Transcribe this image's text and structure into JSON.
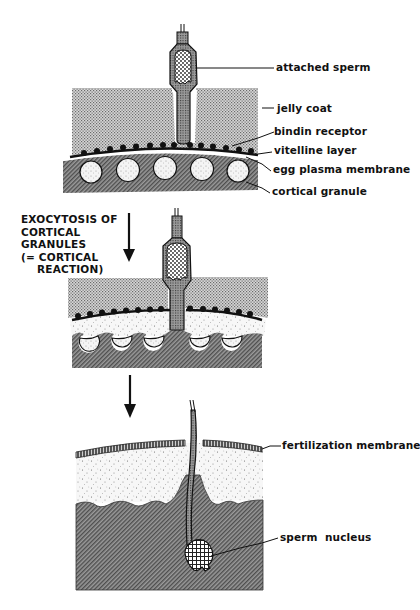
{
  "figure": {
    "panels": [
      {
        "id": "panel-1",
        "stage": "sperm attachment",
        "labels": [
          {
            "key": "attached_sperm",
            "text": "attached sperm"
          },
          {
            "key": "jelly_coat",
            "text": "jelly coat"
          },
          {
            "key": "bindin_receptor",
            "text": "bindin receptor"
          },
          {
            "key": "vitelline_layer",
            "text": "vitelline layer"
          },
          {
            "key": "egg_plasma_membrane",
            "text": "egg plasma membrane"
          },
          {
            "key": "cortical_granule",
            "text": "cortical granule"
          }
        ]
      },
      {
        "id": "panel-2",
        "stage": "cortical reaction",
        "caption_lines": [
          "EXOCYTOSIS OF",
          "CORTICAL",
          "GRANULES",
          "(= CORTICAL",
          "REACTION)"
        ]
      },
      {
        "id": "panel-3",
        "stage": "fertilization membrane formed",
        "labels": [
          {
            "key": "fertilization_membrane",
            "text": "fertilization membrane"
          },
          {
            "key": "sperm_nucleus",
            "text": "sperm  nucleus"
          }
        ]
      }
    ],
    "arrows": [
      {
        "from": "panel-1",
        "to": "panel-2",
        "direction": "down"
      },
      {
        "from": "panel-2",
        "to": "panel-3",
        "direction": "down"
      }
    ],
    "colors": {
      "ink": "#111111",
      "background": "#ffffff",
      "jelly_stipple": "#8a8a8a",
      "cytoplasm_hatch": "#6e6e6e",
      "granule_fill": "#f2f2f2"
    }
  }
}
